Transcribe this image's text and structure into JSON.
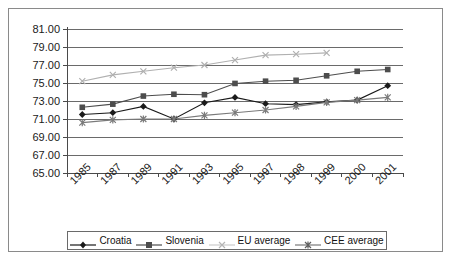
{
  "chart_data": {
    "type": "line",
    "title": "",
    "xlabel": "",
    "ylabel": "",
    "categories": [
      "1985",
      "1987",
      "1989",
      "1991",
      "1993",
      "1995",
      "1997",
      "1998",
      "1999",
      "2000",
      "2001"
    ],
    "ylim": [
      65.0,
      81.0
    ],
    "ytick_labels": [
      "81.00",
      "79.00",
      "77.00",
      "75.00",
      "73.00",
      "71.00",
      "69.00",
      "67.00",
      "65.00"
    ],
    "yticks": [
      81.0,
      79.0,
      77.0,
      75.0,
      73.0,
      71.0,
      69.0,
      67.0,
      65.0
    ],
    "grid": true,
    "legend_position": "bottom",
    "series": [
      {
        "name": "Croatia",
        "marker": "diamond",
        "color": "#1a1a1a",
        "values": [
          71.5,
          71.7,
          72.4,
          71.0,
          72.8,
          73.4,
          72.7,
          72.6,
          72.9,
          73.1,
          74.7
        ]
      },
      {
        "name": "Slovenia",
        "marker": "square",
        "color": "#4d4d4d",
        "values": [
          72.3,
          72.65,
          73.55,
          73.75,
          73.7,
          74.95,
          75.2,
          75.3,
          75.8,
          76.3,
          76.5
        ]
      },
      {
        "name": "EU average",
        "marker": "cross",
        "color": "#b0b0b0",
        "values": [
          75.2,
          75.9,
          76.3,
          76.7,
          77.0,
          77.55,
          78.1,
          78.2,
          78.35,
          null,
          null
        ]
      },
      {
        "name": "CEE average",
        "marker": "star",
        "color": "#7a7a7a",
        "values": [
          70.6,
          70.9,
          71.0,
          71.0,
          71.4,
          71.7,
          72.0,
          72.4,
          72.85,
          73.1,
          73.4
        ]
      }
    ]
  },
  "legend": {
    "items": [
      {
        "label": "Croatia"
      },
      {
        "label": "Slovenia"
      },
      {
        "label": "EU average"
      },
      {
        "label": "CEE average"
      }
    ]
  }
}
